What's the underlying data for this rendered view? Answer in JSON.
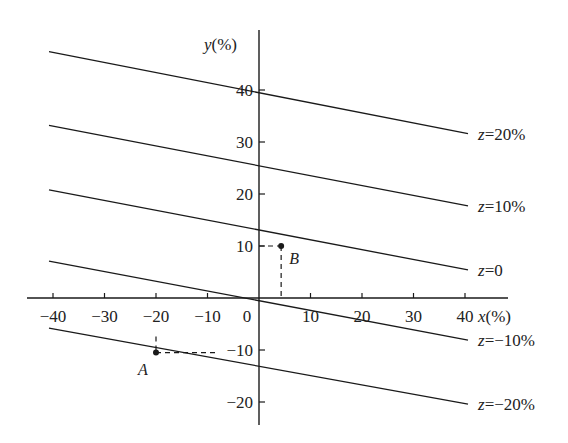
{
  "chart_data": {
    "type": "line",
    "title": "",
    "xlabel": "x(%)",
    "ylabel": "y(%)",
    "xlim": [
      -45,
      48
    ],
    "ylim": [
      -24,
      51
    ],
    "grid": false,
    "x_ticks": [
      -40,
      -30,
      -20,
      -10,
      0,
      10,
      20,
      30,
      40
    ],
    "x_tick_labels": [
      "-40",
      "-30",
      "-20",
      "-10",
      "0",
      "10",
      "20",
      "30",
      "40"
    ],
    "y_ticks": [
      40,
      30,
      20,
      10,
      -10,
      -20
    ],
    "y_tick_labels": [
      "40",
      "30",
      "20",
      "10",
      "-10",
      "-20"
    ],
    "series": [
      {
        "name": "z=20%",
        "label": "z=20%",
        "x": [
          -40,
          40
        ],
        "y": [
          47.4,
          31.6
        ]
      },
      {
        "name": "z=10%",
        "label": "z=10%",
        "x": [
          -40,
          40
        ],
        "y": [
          33.2,
          17.7
        ]
      },
      {
        "name": "z=0",
        "label": "z=0",
        "x": [
          -40,
          40
        ],
        "y": [
          20.8,
          5.4
        ]
      },
      {
        "name": "z=-10%",
        "label": "z=-10%",
        "x": [
          -40,
          40
        ],
        "y": [
          7.1,
          -8.1
        ]
      },
      {
        "name": "z=-20%",
        "label": "z=-20%",
        "x": [
          -40,
          40
        ],
        "y": [
          -5.8,
          -20.4
        ]
      }
    ],
    "points": [
      {
        "name": "A",
        "x": -20,
        "y": -10.5
      },
      {
        "name": "B",
        "x": 4.3,
        "y": 10
      }
    ],
    "annotations": [
      "Dashed guide from A to y-axis at y=-10 and up to x-axis at x=-20",
      "Dashed guide from B to y-axis at y=10 and down to x-axis"
    ]
  },
  "labels": {
    "x_axis": "x(%)",
    "y_axis": "y(%)",
    "point_a": "A",
    "point_b": "B",
    "origin": "0"
  }
}
